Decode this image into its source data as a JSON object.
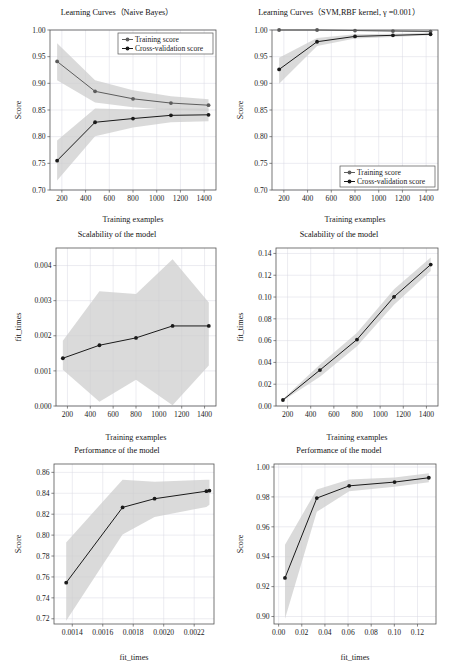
{
  "figure": {
    "background": "#ffffff",
    "grid_color": "#d9d9e3",
    "band_color": "#cccccc",
    "train_color": "#5c5c5c",
    "cv_color": "#1a1a1a"
  },
  "legend": {
    "training_label": "Training score",
    "cv_label": "Cross-validation score"
  },
  "chart_data": [
    {
      "id": "nb-learning-curve",
      "type": "line",
      "title": "Learning Curves（Naive Bayes）",
      "xlabel": "Training examples",
      "ylabel": "Score",
      "xlim": [
        100,
        1500
      ],
      "ylim": [
        0.7,
        1.0
      ],
      "xticks": [
        200,
        400,
        600,
        800,
        1000,
        1200,
        1400
      ],
      "xticklabels": [
        "200",
        "400",
        "600",
        "800",
        "1000",
        "1200",
        "1400"
      ],
      "yticks": [
        0.7,
        0.75,
        0.8,
        0.85,
        0.9,
        0.95,
        1.0
      ],
      "yticklabels": [
        "0.70",
        "0.75",
        "0.80",
        "0.85",
        "0.90",
        "0.95",
        "1.00"
      ],
      "grid": true,
      "legend_position": "upper right",
      "x": [
        160,
        480,
        800,
        1120,
        1437
      ],
      "series": [
        {
          "name": "Training score",
          "values": [
            0.941,
            0.885,
            0.871,
            0.863,
            0.859
          ],
          "band_lower": [
            0.906,
            0.864,
            0.855,
            0.85,
            0.848
          ],
          "band_upper": [
            0.975,
            0.906,
            0.887,
            0.876,
            0.87
          ]
        },
        {
          "name": "Cross-validation score",
          "values": [
            0.755,
            0.827,
            0.834,
            0.84,
            0.841
          ],
          "band_lower": [
            0.718,
            0.801,
            0.817,
            0.827,
            0.829
          ],
          "band_upper": [
            0.793,
            0.853,
            0.851,
            0.853,
            0.853
          ]
        }
      ]
    },
    {
      "id": "svm-learning-curve",
      "type": "line",
      "title": "Learning Curves（SVM,RBF kernel, γ =0.001）",
      "xlabel": "Training examples",
      "ylabel": "Score",
      "xlim": [
        100,
        1500
      ],
      "ylim": [
        0.7,
        1.0
      ],
      "xticks": [
        200,
        400,
        600,
        800,
        1000,
        1200,
        1400
      ],
      "xticklabels": [
        "200",
        "400",
        "600",
        "800",
        "1000",
        "1200",
        "1400"
      ],
      "yticks": [
        0.7,
        0.75,
        0.8,
        0.85,
        0.9,
        0.95,
        1.0
      ],
      "yticklabels": [
        "0.70",
        "0.75",
        "0.80",
        "0.85",
        "0.90",
        "0.95",
        "1.00"
      ],
      "grid": true,
      "legend_position": "lower right",
      "x": [
        160,
        480,
        800,
        1120,
        1437
      ],
      "series": [
        {
          "name": "Training score",
          "values": [
            1.0,
            1.0,
            0.999,
            0.998,
            0.997
          ],
          "band_lower": [
            1.0,
            0.999,
            0.998,
            0.997,
            0.996
          ],
          "band_upper": [
            1.0,
            1.0,
            1.0,
            1.0,
            0.999
          ]
        },
        {
          "name": "Cross-validation score",
          "values": [
            0.926,
            0.978,
            0.988,
            0.99,
            0.992
          ],
          "band_lower": [
            0.899,
            0.97,
            0.984,
            0.987,
            0.99
          ],
          "band_upper": [
            0.948,
            0.985,
            0.992,
            0.993,
            0.995
          ]
        }
      ]
    },
    {
      "id": "nb-scalability",
      "type": "line",
      "title": "Scalability of the model",
      "xlabel": "Training examples",
      "ylabel": "fit_times",
      "xlim": [
        100,
        1500
      ],
      "ylim": [
        0.0,
        0.0045
      ],
      "xticks": [
        200,
        400,
        600,
        800,
        1000,
        1200,
        1400
      ],
      "xticklabels": [
        "200",
        "400",
        "600",
        "800",
        "1000",
        "1200",
        "1400"
      ],
      "yticks": [
        0.0,
        0.001,
        0.002,
        0.003,
        0.004
      ],
      "yticklabels": [
        "0.000",
        "0.001",
        "0.002",
        "0.003",
        "0.004"
      ],
      "grid": true,
      "legend_position": "none",
      "x": [
        160,
        480,
        800,
        1120,
        1437
      ],
      "series": [
        {
          "name": "fit_times",
          "values": [
            0.00136,
            0.00173,
            0.00194,
            0.00228,
            0.00228
          ],
          "band_lower": [
            0.00103,
            0.00012,
            0.00075,
            2e-05,
            0.00115
          ],
          "band_upper": [
            0.00186,
            0.00327,
            0.00319,
            0.00418,
            0.00295
          ]
        }
      ]
    },
    {
      "id": "svm-scalability",
      "type": "line",
      "title": "Scalability of the model",
      "xlabel": "Training examples",
      "ylabel": "fit_times",
      "xlim": [
        100,
        1500
      ],
      "ylim": [
        0.0,
        0.145
      ],
      "xticks": [
        200,
        400,
        600,
        800,
        1000,
        1200,
        1400
      ],
      "xticklabels": [
        "200",
        "400",
        "600",
        "800",
        "1000",
        "1200",
        "1400"
      ],
      "yticks": [
        0.0,
        0.02,
        0.04,
        0.06,
        0.08,
        0.1,
        0.12,
        0.14
      ],
      "yticklabels": [
        "0.00",
        "0.02",
        "0.04",
        "0.06",
        "0.08",
        "0.10",
        "0.12",
        "0.14"
      ],
      "grid": true,
      "legend_position": "none",
      "x": [
        160,
        480,
        800,
        1120,
        1437
      ],
      "series": [
        {
          "name": "fit_times",
          "values": [
            0.0055,
            0.033,
            0.061,
            0.1002,
            0.1298
          ],
          "band_lower": [
            0.0048,
            0.0268,
            0.0548,
            0.093,
            0.1238
          ],
          "band_upper": [
            0.0064,
            0.0382,
            0.0672,
            0.1072,
            0.1362
          ]
        }
      ]
    },
    {
      "id": "nb-performance",
      "type": "line",
      "title": "Performance of the model",
      "xlabel": "fit_times",
      "ylabel": "Score",
      "xlim": [
        0.00128,
        0.00233
      ],
      "ylim": [
        0.715,
        0.868
      ],
      "xticks": [
        0.0014,
        0.0016,
        0.0018,
        0.002,
        0.0022
      ],
      "xticklabels": [
        "0.0014",
        "0.0016",
        "0.0018",
        "0.0020",
        "0.0022"
      ],
      "yticks": [
        0.72,
        0.74,
        0.76,
        0.78,
        0.8,
        0.82,
        0.84,
        0.86
      ],
      "yticklabels": [
        "0.72",
        "0.74",
        "0.76",
        "0.78",
        "0.80",
        "0.82",
        "0.84",
        "0.86"
      ],
      "grid": true,
      "legend_position": "none",
      "x": [
        0.00136,
        0.00173,
        0.00194,
        0.00228,
        0.0023
      ],
      "series": [
        {
          "name": "Score",
          "values": [
            0.7545,
            0.8265,
            0.8348,
            0.842,
            0.8425
          ],
          "band_lower": [
            0.7182,
            0.8005,
            0.8172,
            0.827,
            0.829
          ],
          "band_upper": [
            0.793,
            0.853,
            0.851,
            0.853,
            0.853
          ]
        }
      ]
    },
    {
      "id": "svm-performance",
      "type": "line",
      "title": "Performance of the model",
      "xlabel": "fit_times",
      "ylabel": "Score",
      "xlim": [
        -0.004,
        0.136
      ],
      "ylim": [
        0.895,
        1.002
      ],
      "xticks": [
        0.0,
        0.02,
        0.04,
        0.06,
        0.08,
        0.1,
        0.12
      ],
      "xticklabels": [
        "0.00",
        "0.02",
        "0.04",
        "0.06",
        "0.08",
        "0.10",
        "0.12"
      ],
      "yticks": [
        0.9,
        0.92,
        0.94,
        0.96,
        0.98,
        1.0
      ],
      "yticklabels": [
        "0.90",
        "0.92",
        "0.94",
        "0.96",
        "0.98",
        "1.00"
      ],
      "grid": true,
      "legend_position": "none",
      "x": [
        0.0055,
        0.033,
        0.061,
        0.1002,
        0.1298
      ],
      "series": [
        {
          "name": "Score",
          "values": [
            0.9258,
            0.9792,
            0.9874,
            0.9899,
            0.9928
          ],
          "band_lower": [
            0.8985,
            0.97,
            0.9838,
            0.9868,
            0.9898
          ],
          "band_upper": [
            0.948,
            0.985,
            0.9916,
            0.993,
            0.9958
          ]
        }
      ]
    }
  ]
}
